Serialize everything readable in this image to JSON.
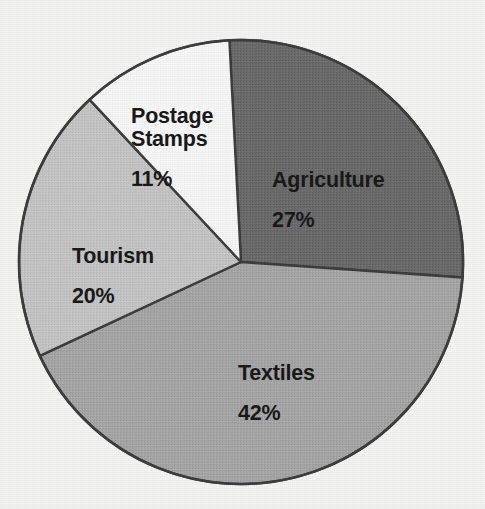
{
  "chart_data": {
    "type": "pie",
    "title": "",
    "subtitle": "",
    "xlabel": "",
    "ylabel": "",
    "legend_position": "none",
    "labels_inside_slices": true,
    "unit": "%",
    "total": 100,
    "categories": [
      "Agriculture",
      "Textiles",
      "Tourism",
      "Postage Stamps"
    ],
    "values": [
      27,
      42,
      20,
      11
    ],
    "slices": [
      {
        "name": "Agriculture",
        "value": 27,
        "value_label": "27%",
        "color": "#6a6a6a",
        "start_angle_deg": 357,
        "end_angle_deg": 454
      },
      {
        "name": "Textiles",
        "value": 42,
        "value_label": "42%",
        "color": "#a5a5a5",
        "start_angle_deg": 94,
        "end_angle_deg": 245
      },
      {
        "name": "Tourism",
        "value": 20,
        "value_label": "20%",
        "color": "#c4c4c4",
        "start_angle_deg": 245,
        "end_angle_deg": 317
      },
      {
        "name": "Postage Stamps",
        "value": 11,
        "value_label": "11%",
        "color": "#f7f7f7",
        "start_angle_deg": 317,
        "end_angle_deg": 357
      }
    ]
  },
  "figure": {
    "background_color": "#f3f3f2",
    "outline_color": "#3b3b3b",
    "label_text_color": "#161616",
    "center_x": 241,
    "center_y": 262,
    "radius": 222
  },
  "labels": {
    "agriculture": {
      "name": "Agriculture",
      "value": "27%"
    },
    "textiles": {
      "name": "Textiles",
      "value": "42%"
    },
    "tourism": {
      "name": "Tourism",
      "value": "20%"
    },
    "postage": {
      "name": "Postage\nStamps",
      "value": "11%"
    }
  }
}
